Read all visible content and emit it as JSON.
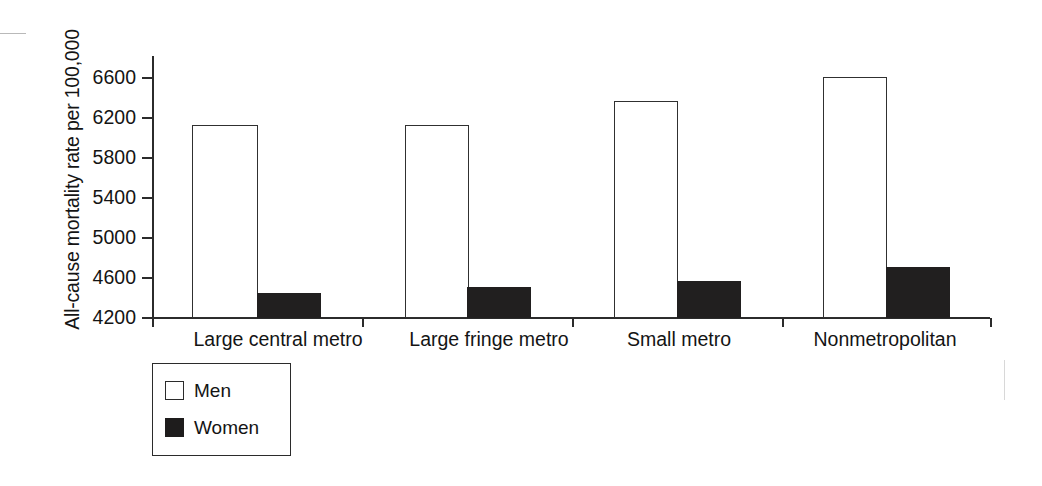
{
  "chart_data": {
    "type": "bar",
    "title": "",
    "xlabel": "",
    "ylabel": "All-cause mortality rate per 100,000",
    "categories": [
      "Large central metro",
      "Large fringe metro",
      "Small metro",
      "Nonmetropolitan"
    ],
    "series": [
      {
        "name": "Men",
        "color": "#ffffff",
        "values": [
          6130,
          6130,
          6370,
          6610
        ]
      },
      {
        "name": "Women",
        "color": "#211f1f",
        "values": [
          4450,
          4510,
          4570,
          4710
        ]
      }
    ],
    "ylim": [
      4200,
      6800
    ],
    "yticks": [
      4200,
      4600,
      5000,
      5400,
      5800,
      6200,
      6600
    ],
    "ytick_labels": [
      "4200",
      "4600",
      "5000",
      "5400",
      "5800",
      "6200",
      "6600"
    ],
    "grid": false,
    "legend": {
      "position": "bottom-left",
      "entries": [
        "Men",
        "Women"
      ]
    }
  },
  "axis": {
    "y_title": "All-cause mortality rate per 100,000",
    "ticks": [
      {
        "label": "6600"
      },
      {
        "label": "6200"
      },
      {
        "label": "5800"
      },
      {
        "label": "5400"
      },
      {
        "label": "5000"
      },
      {
        "label": "4600"
      },
      {
        "label": "4200"
      }
    ],
    "categories": [
      {
        "label": "Large central metro"
      },
      {
        "label": "Large fringe metro"
      },
      {
        "label": "Small metro"
      },
      {
        "label": "Nonmetropolitan"
      }
    ]
  },
  "legend": {
    "items": [
      {
        "label": "Men",
        "fill": "white"
      },
      {
        "label": "Women",
        "fill": "black"
      }
    ]
  }
}
